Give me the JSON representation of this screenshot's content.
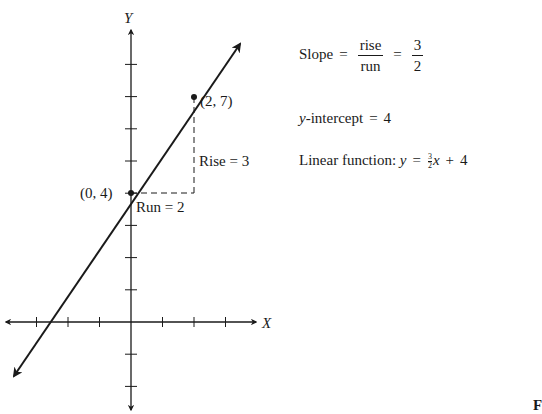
{
  "chart_data": {
    "type": "line",
    "title": "",
    "xlabel": "X",
    "ylabel": "Y",
    "xlim": [
      -4,
      4
    ],
    "ylim": [
      -3,
      8
    ],
    "grid": false,
    "series": [
      {
        "name": "y = 3/2 x + 4",
        "slope": 1.5,
        "intercept": 4,
        "x": [
          -4,
          0,
          2,
          3.5
        ],
        "y": [
          -2,
          4,
          7,
          9.25
        ]
      }
    ],
    "points": [
      {
        "label": "(0, 4)",
        "x": 0,
        "y": 4
      },
      {
        "label": "(2, 7)",
        "x": 2,
        "y": 7
      }
    ],
    "annotations": [
      {
        "text": "Rise = 3",
        "type": "vertical-dashed",
        "from": [
          2,
          4
        ],
        "to": [
          2,
          7
        ]
      },
      {
        "text": "Run = 2",
        "type": "horizontal-dashed",
        "from": [
          0,
          4
        ],
        "to": [
          2,
          4
        ]
      }
    ]
  },
  "axes": {
    "x_label": "X",
    "y_label": "Y",
    "x_ticks": [
      -3,
      -2,
      -1,
      1,
      2,
      3
    ],
    "y_ticks": [
      -2,
      -1,
      1,
      2,
      3,
      4,
      5,
      6,
      7,
      8
    ]
  },
  "labels": {
    "point_a": "(0, 4)",
    "point_b": "(2, 7)",
    "rise": "Rise = 3",
    "run": "Run = 2"
  },
  "formulas": {
    "slope_word": "Slope",
    "equals": "=",
    "rise_word": "rise",
    "run_word": "run",
    "slope_num": "3",
    "slope_den": "2",
    "intercept_var": "y",
    "intercept_text": "-intercept",
    "intercept_value": "4",
    "linear_label": "Linear function:",
    "linear_y": "y",
    "linear_frac_num": "3",
    "linear_frac_den": "2",
    "linear_x": "x",
    "linear_plus": "+",
    "linear_const": "4"
  },
  "corner_fragment": "F",
  "colors": {
    "ink": "#1a1a1a",
    "background": "#ffffff"
  }
}
